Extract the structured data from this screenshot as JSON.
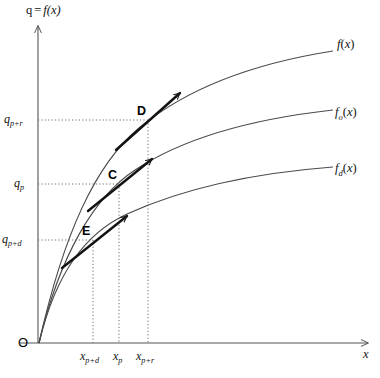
{
  "figure": {
    "type": "diagram",
    "background_color": "#ffffff",
    "ink_color": "#3a3a3a",
    "axis_color": "#555555",
    "width": 380,
    "height": 378
  },
  "axes": {
    "y_axis_title": "q = f(x)",
    "y_axis_title_parts": {
      "lhs": "q",
      "eq": "=",
      "fn": "f(x)"
    },
    "x_axis_title": "x",
    "origin_label": "O",
    "x_origin_px": 38,
    "y_origin_px": 343,
    "x_axis_end_px": 372,
    "y_axis_end_px": 22
  },
  "y_ticks": [
    {
      "id": "q-p-plus-r",
      "base": "q",
      "sub": "p+r",
      "value_px": 120
    },
    {
      "id": "q-p",
      "base": "q",
      "sub": "p",
      "value_px": 184
    },
    {
      "id": "q-p-plus-d",
      "base": "q",
      "sub": "p+d",
      "value_px": 240
    }
  ],
  "x_ticks": [
    {
      "id": "x-p-plus-d",
      "base": "x",
      "sub": "p+d",
      "value_px": 93
    },
    {
      "id": "x-p",
      "base": "x",
      "sub": "p",
      "value_px": 119
    },
    {
      "id": "x-p-plus-r",
      "base": "x",
      "sub": "p+r",
      "value_px": 148
    }
  ],
  "curves": [
    {
      "id": "curve-f",
      "base": "f",
      "sub": "",
      "label": "f(x)",
      "label_x_px": 337,
      "label_y_px": 44
    },
    {
      "id": "curve-f-o",
      "base": "f",
      "sub": "o",
      "label": "fo(x)",
      "label_x_px": 337,
      "label_y_px": 112
    },
    {
      "id": "curve-f-d",
      "base": "f",
      "sub": "d",
      "label": "fd(x)",
      "label_x_px": 337,
      "label_y_px": 168
    }
  ],
  "points": [
    {
      "id": "point-D",
      "label": "D",
      "x_px": 148,
      "y_px": 120,
      "on_curve": "curve-f"
    },
    {
      "id": "point-C",
      "label": "C",
      "x_px": 119,
      "y_px": 184,
      "on_curve": "curve-f-o"
    },
    {
      "id": "point-E",
      "label": "E",
      "x_px": 93,
      "y_px": 240,
      "on_curve": "curve-f-d"
    }
  ],
  "tangents": [
    {
      "id": "tangent-at-D",
      "at_point": "D",
      "has_arrow": true
    },
    {
      "id": "tangent-at-C",
      "at_point": "C",
      "has_arrow": true
    },
    {
      "id": "tangent-at-E",
      "at_point": "E",
      "has_arrow": true
    }
  ],
  "guides": {
    "style": "dotted",
    "horizontal_from_y_axis": true,
    "vertical_to_x_axis": true
  }
}
